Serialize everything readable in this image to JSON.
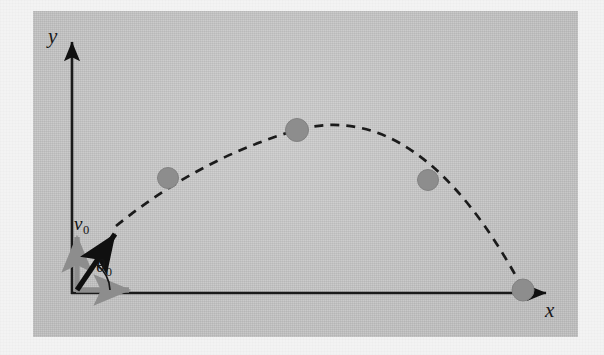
{
  "figure": {
    "kind": "projectile-motion-diagram",
    "panel": {
      "background_color": "#c8c8c8",
      "page_color": "#f3f3f3",
      "x": 33,
      "y": 11,
      "width": 545,
      "height": 326
    }
  },
  "axes": {
    "origin": {
      "x": 72,
      "y": 293
    },
    "y_axis": {
      "label": "y",
      "color": "#1a1a1a",
      "from": {
        "x": 72,
        "y": 293
      },
      "to": {
        "x": 72,
        "y": 36
      }
    },
    "x_axis": {
      "label": "x",
      "color": "#1a1a1a",
      "from": {
        "x": 72,
        "y": 293
      },
      "to": {
        "x": 552,
        "y": 293
      }
    }
  },
  "vectors": {
    "initial_velocity": {
      "label": "v",
      "subscript": "0",
      "color": "#101010",
      "angle_degrees": 53,
      "from": {
        "x": 77,
        "y": 289
      },
      "to": {
        "x": 119,
        "y": 228
      }
    },
    "vertical_component": {
      "name": "v0y-component-arrow",
      "color": "#8d8d8d",
      "from": {
        "x": 77,
        "y": 290
      },
      "to": {
        "x": 77,
        "y": 231
      }
    },
    "horizontal_component": {
      "name": "v0x-component-arrow",
      "color": "#8d8d8d",
      "from": {
        "x": 76,
        "y": 290
      },
      "to": {
        "x": 135,
        "y": 290
      }
    },
    "launch_angle": {
      "label": "θ",
      "subscript": "0",
      "color": "#151515",
      "value_degrees": 53,
      "arc_radius": 33
    }
  },
  "trajectory": {
    "style": "dashed",
    "color": "#1b1b1b",
    "dash_length": 9,
    "dash_gap": 7,
    "stroke_width": 2.6,
    "path_points": [
      {
        "x": 116,
        "y": 226
      },
      {
        "x": 168,
        "y": 178
      },
      {
        "x": 232,
        "y": 143
      },
      {
        "x": 297,
        "y": 130
      },
      {
        "x": 364,
        "y": 147
      },
      {
        "x": 428,
        "y": 180
      },
      {
        "x": 480,
        "y": 225
      },
      {
        "x": 523,
        "y": 289
      }
    ]
  },
  "markers": {
    "color": "#8d8d8d",
    "edge_color": "#7f7f7f",
    "radius": 11,
    "points": [
      {
        "name": "marker-ascending",
        "x": 168,
        "y": 178
      },
      {
        "name": "marker-apex",
        "x": 297,
        "y": 130
      },
      {
        "name": "marker-descending",
        "x": 428,
        "y": 180
      },
      {
        "name": "marker-landing",
        "x": 523,
        "y": 290
      }
    ]
  }
}
